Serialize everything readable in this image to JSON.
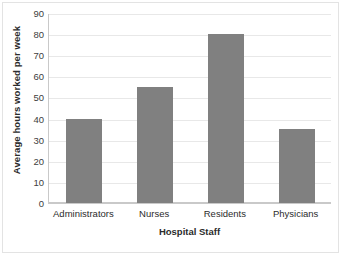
{
  "chart_data": {
    "type": "bar",
    "title": "",
    "subtitle": "",
    "xlabel": "Hospital Staff",
    "ylabel": "Average hours worked per week",
    "categories": [
      "Administrators",
      "Nurses",
      "Residents",
      "Physicians"
    ],
    "values": [
      40,
      55,
      80,
      35
    ],
    "series": [
      {
        "name": "Average hours worked per week",
        "values": [
          40,
          55,
          80,
          35
        ]
      }
    ],
    "ylim": [
      0,
      90
    ],
    "ytick_step": 10,
    "yticks": [
      0,
      10,
      20,
      30,
      40,
      50,
      60,
      70,
      80,
      90
    ],
    "ytick_labels": [
      "0",
      "10",
      "20",
      "30",
      "40",
      "50",
      "60",
      "70",
      "80",
      "90"
    ],
    "grid": true,
    "grid_axis": "y",
    "legend": false,
    "legend_position": "none",
    "annotations": [],
    "colors": {
      "bar": "#808080",
      "gridline": "#e8e8e8",
      "axis": "#c9c9c9",
      "text": "#2b2b2b",
      "tick_text": "#404040",
      "background": "#ffffff",
      "frame": "#e3e3e3"
    }
  }
}
